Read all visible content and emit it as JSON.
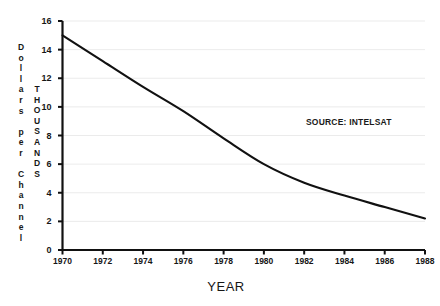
{
  "chart_data": {
    "type": "line",
    "title": "",
    "subtitle": "",
    "xlabel": "YEAR",
    "ylabel": "Dollars per Channel",
    "ylabel_secondary": "THOUSANDS",
    "x": [
      1970,
      1972,
      1974,
      1976,
      1978,
      1980,
      1982,
      1984,
      1986,
      1988
    ],
    "values": [
      15.0,
      13.2,
      11.4,
      9.7,
      7.8,
      6.0,
      4.7,
      3.8,
      3.0,
      2.2
    ],
    "series": [
      {
        "name": "Cost per channel",
        "values": [
          15.0,
          13.2,
          11.4,
          9.7,
          7.8,
          6.0,
          4.7,
          3.8,
          3.0,
          2.2
        ]
      }
    ],
    "categories": [
      "1970",
      "1972",
      "1974",
      "1976",
      "1978",
      "1980",
      "1982",
      "1984",
      "1986",
      "1988"
    ],
    "xlim": [
      1970,
      1988
    ],
    "ylim": [
      0,
      16
    ],
    "yticks": [
      0,
      2,
      4,
      6,
      8,
      10,
      12,
      14,
      16
    ],
    "ytick_labels": [
      "0",
      "2",
      "4",
      "6",
      "8",
      "10",
      "12",
      "14",
      "16"
    ],
    "xticks": [
      1970,
      1972,
      1974,
      1976,
      1978,
      1980,
      1982,
      1984,
      1986,
      1988
    ],
    "xtick_labels": [
      "1970",
      "1972",
      "1974",
      "1976",
      "1978",
      "1980",
      "1982",
      "1984",
      "1986",
      "1988"
    ],
    "grid": "horizontal-faint",
    "legend": "none",
    "line_color": "#111111",
    "grid_color": "#e2e2e2",
    "axis_color": "#111111",
    "background_color": "#ffffff"
  },
  "annotations": {
    "source": "SOURCE: INTELSAT"
  },
  "axis_titles": {
    "y_primary_chars": [
      "D",
      "o",
      "l",
      "l",
      "a",
      "r",
      "s",
      "",
      "p",
      "e",
      "r",
      "",
      "C",
      "h",
      "a",
      "n",
      "n",
      "e",
      "l"
    ],
    "y_secondary_chars": [
      "T",
      "H",
      "O",
      "U",
      "S",
      "A",
      "N",
      "D",
      "S"
    ],
    "x": "YEAR"
  }
}
